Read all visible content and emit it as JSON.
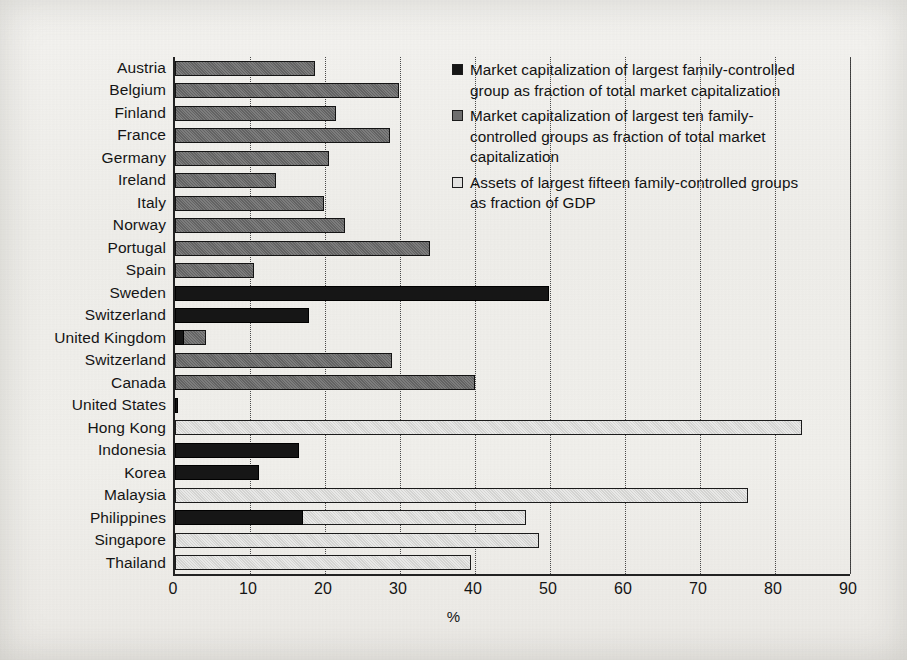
{
  "chart_data": {
    "type": "bar",
    "orientation": "horizontal",
    "title": "",
    "xlabel": "%",
    "ylabel": "",
    "xlim": [
      0,
      90
    ],
    "xticks": [
      0,
      10,
      20,
      30,
      40,
      50,
      60,
      70,
      80,
      90
    ],
    "grid": true,
    "legend_position": "top-right",
    "categories": [
      "Austria",
      "Belgium",
      "Finland",
      "France",
      "Germany",
      "Ireland",
      "Italy",
      "Norway",
      "Portugal",
      "Spain",
      "Sweden",
      "Switzerland",
      "United Kingdom",
      "Switzerland",
      "Canada",
      "United States",
      "Hong Kong",
      "Indonesia",
      "Korea",
      "Malaysia",
      "Philippines",
      "Singapore",
      "Thailand"
    ],
    "series": [
      {
        "name": "Market capitalization of largest family-controlled group as fraction of total market capitalization",
        "key": "largest_one",
        "color": "#161616",
        "values": [
          null,
          null,
          null,
          null,
          null,
          null,
          null,
          null,
          null,
          null,
          49.8,
          17.8,
          1.2,
          null,
          null,
          0.4,
          null,
          16.5,
          11.2,
          null,
          17.0,
          null,
          null
        ]
      },
      {
        "name": "Market capitalization of largest ten family-controlled groups as fraction of total market capitalization",
        "key": "largest_ten",
        "color": "#6e6e6e",
        "values": [
          18.7,
          29.8,
          21.5,
          28.7,
          20.5,
          13.5,
          19.8,
          22.7,
          34.0,
          10.5,
          null,
          null,
          4.1,
          28.9,
          40.0,
          null,
          null,
          null,
          null,
          null,
          null,
          null,
          null
        ]
      },
      {
        "name": "Assets of largest fifteen family-controlled groups as fraction of GDP",
        "key": "largest_fifteen_assets",
        "color": "#e2e2e0",
        "values": [
          null,
          null,
          null,
          null,
          null,
          null,
          null,
          null,
          null,
          null,
          null,
          null,
          null,
          null,
          null,
          null,
          83.6,
          null,
          null,
          76.4,
          46.8,
          48.5,
          39.5
        ]
      }
    ]
  },
  "legend": {
    "items": [
      {
        "swatch": "s0",
        "label": "Market capitalization of largest family-controlled group as fraction of total market capitalization"
      },
      {
        "swatch": "s1",
        "label": "Market capitalization of largest ten family-controlled groups as fraction of total market capitalization"
      },
      {
        "swatch": "s2",
        "label": "Assets of largest fifteen family-controlled groups as fraction of GDP"
      }
    ]
  }
}
